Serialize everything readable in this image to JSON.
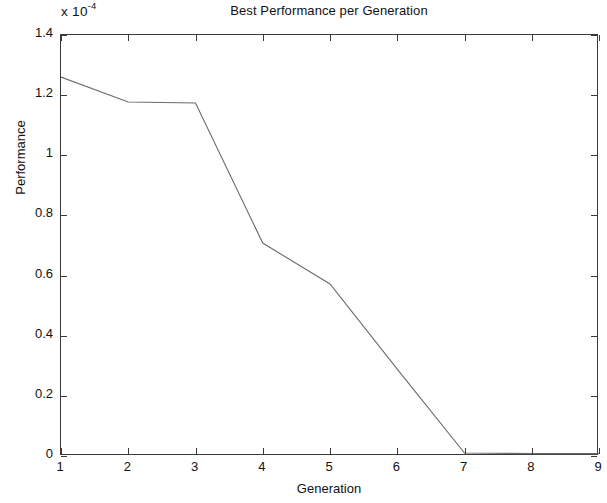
{
  "chart_data": {
    "type": "line",
    "title": "Best Performance per Generation",
    "xlabel": "Generation",
    "ylabel": "Performance",
    "y_exponent_mantissa": "x 10",
    "y_exponent_power": "-4",
    "y_scale_note": "values are in units of 1e-4",
    "grid": false,
    "legend": null,
    "xlim": [
      1,
      9
    ],
    "ylim": [
      0,
      1.4
    ],
    "xticks": [
      1,
      2,
      3,
      4,
      5,
      6,
      7,
      8,
      9
    ],
    "xticklabels": [
      "1",
      "2",
      "3",
      "4",
      "5",
      "6",
      "7",
      "8",
      "9"
    ],
    "yticks": [
      0,
      0.2,
      0.4,
      0.6,
      0.8,
      1,
      1.2,
      1.4
    ],
    "yticklabels": [
      "0",
      "0.2",
      "0.4",
      "0.6",
      "0.8",
      "1",
      "1.2",
      "1.4"
    ],
    "series": [
      {
        "name": "Best Performance",
        "color": "#6b6b6b",
        "linewidth": 1,
        "x": [
          1,
          2,
          3,
          4,
          5,
          6,
          7,
          8,
          9
        ],
        "values": [
          1.26,
          1.177,
          1.174,
          0.708,
          0.572,
          0.289,
          0.01,
          0.008,
          0.008
        ]
      }
    ]
  },
  "figure": {
    "background_color": "#ffffff",
    "axis_color": "#3a3a3a",
    "text_color": "#111111"
  }
}
